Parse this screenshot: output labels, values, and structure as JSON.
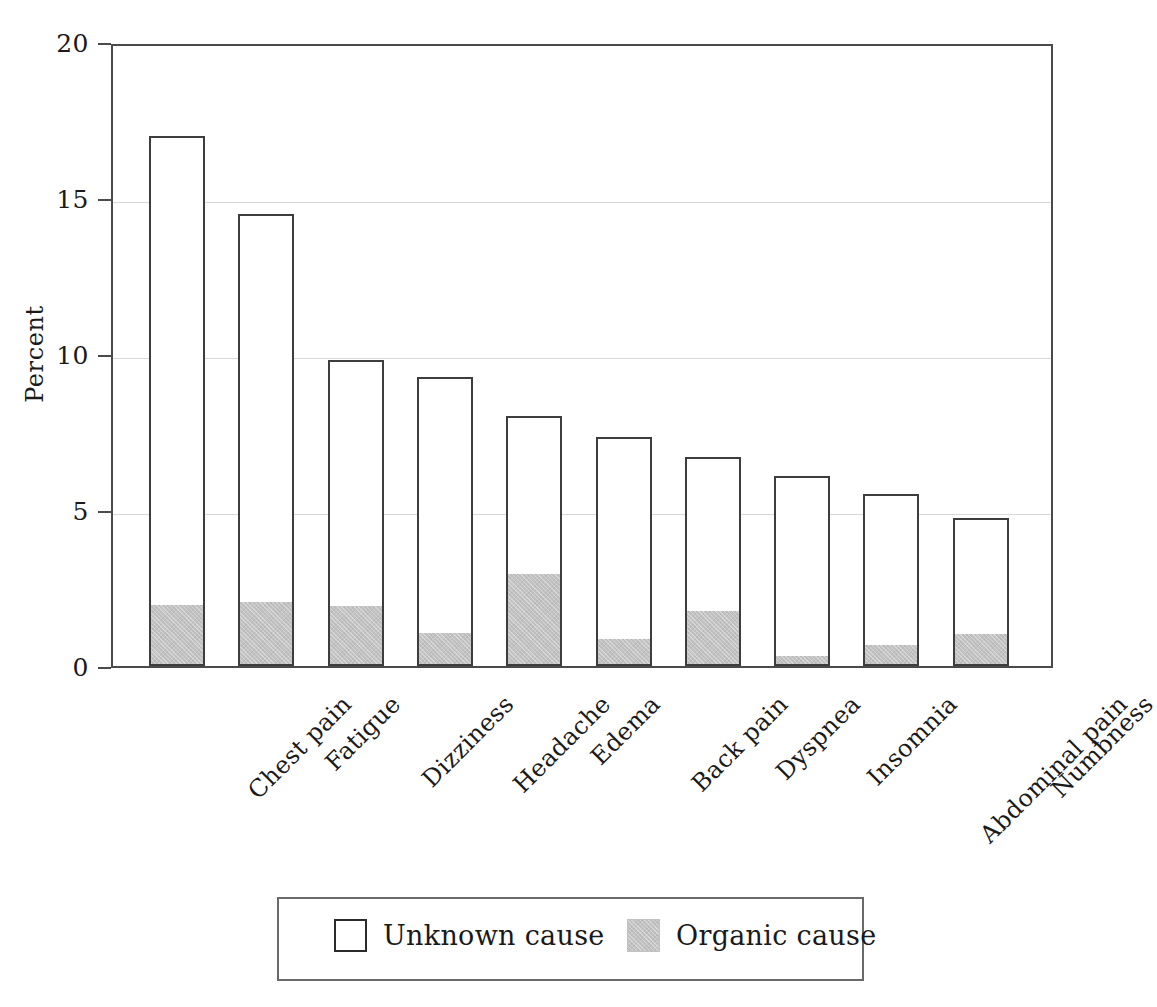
{
  "chart_data": {
    "type": "bar",
    "subtype": "stacked-vertical",
    "title": "",
    "xlabel": "",
    "ylabel": "Percent",
    "ylim": [
      0,
      20
    ],
    "yticks": [
      0,
      5,
      10,
      15,
      20
    ],
    "ytick_labels": [
      "0",
      "5",
      "10",
      "15",
      "20"
    ],
    "grid": true,
    "grid_axis": "y",
    "legend_position": "bottom-center",
    "categories": [
      "Chest pain",
      "Fatigue",
      "Dizziness",
      "Headache",
      "Edema",
      "Back pain",
      "Dyspnea",
      "Insomnia",
      "Abdominal pain",
      "Numbness"
    ],
    "series": [
      {
        "name": "Organic cause",
        "color": "#c2c2c2",
        "values": [
          1.9,
          2.0,
          1.85,
          1.0,
          2.9,
          0.8,
          1.7,
          0.25,
          0.6,
          0.95
        ]
      },
      {
        "name": "Unknown cause",
        "color": "#ffffff",
        "note": "drawn as the remainder of each total bar above the organic segment",
        "values": [
          15.1,
          12.5,
          7.95,
          8.25,
          5.1,
          6.55,
          5.0,
          5.85,
          4.9,
          3.8
        ]
      }
    ],
    "totals": [
      17.0,
      14.5,
      9.8,
      9.25,
      8.0,
      7.35,
      6.7,
      6.1,
      5.5,
      4.75
    ]
  },
  "axis": {
    "y_title": "Percent",
    "y_tick_labels": [
      "20",
      "15",
      "10",
      "5",
      "0"
    ]
  },
  "legend": {
    "items": [
      {
        "label": "Unknown cause",
        "swatch": "unknown-cause-swatch"
      },
      {
        "label": "Organic cause",
        "swatch": "organic-cause-swatch"
      }
    ]
  },
  "colors": {
    "organic_fill": "#c2c2c2",
    "unknown_fill": "#ffffff",
    "bar_stroke": "#3d3d3d",
    "axis": "#4a4a4a",
    "gridline": "#d8d8d8",
    "text": "#1a1a1a"
  }
}
